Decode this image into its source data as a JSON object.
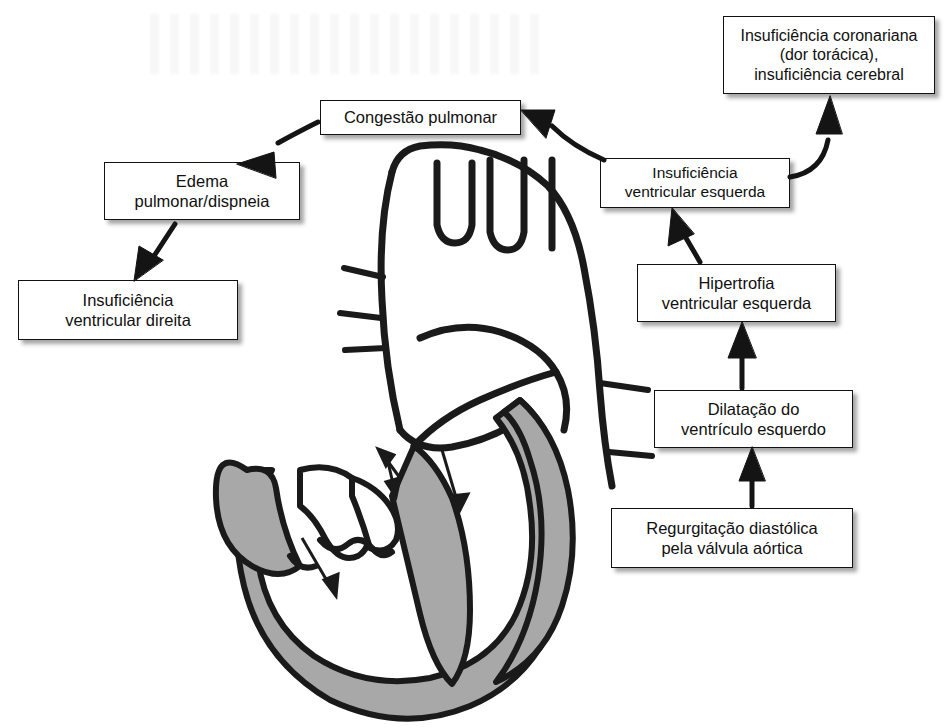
{
  "diagram": {
    "language": "pt-BR",
    "nodes": [
      {
        "id": "regurgitacao",
        "label": "Regurgitação diastólica\npela válvula aórtica"
      },
      {
        "id": "dilatacao",
        "label": "Dilatação do\nventrículo esquerdo"
      },
      {
        "id": "hipertrofia",
        "label": "Hipertrofia\nventricular esquerda"
      },
      {
        "id": "insuficiencia_ventricular_esquerda",
        "label": "Insuficiência\nventricular esquerda"
      },
      {
        "id": "insuficiencia_coronariana",
        "label": "Insuficiência coronariana\n(dor torácica),\ninsuficiência cerebral"
      },
      {
        "id": "congestao_pulmonar",
        "label": "Congestão pulmonar"
      },
      {
        "id": "edema_pulmonar",
        "label": "Edema\npulmonar/dispneia"
      },
      {
        "id": "insuficiencia_ventricular_direita",
        "label": "Insuficiência\nventricular direita"
      }
    ],
    "edges": [
      {
        "from": "regurgitacao",
        "to": "dilatacao",
        "direction": "up"
      },
      {
        "from": "dilatacao",
        "to": "hipertrofia",
        "direction": "up"
      },
      {
        "from": "hipertrofia",
        "to": "insuficiencia_ventricular_esquerda",
        "direction": "up"
      },
      {
        "from": "insuficiencia_ventricular_esquerda",
        "to": "insuficiencia_coronariana",
        "direction": "up-curved"
      },
      {
        "from": "insuficiencia_ventricular_esquerda",
        "to": "congestao_pulmonar",
        "direction": "left"
      },
      {
        "from": "congestao_pulmonar",
        "to": "edema_pulmonar",
        "direction": "down-left"
      },
      {
        "from": "edema_pulmonar",
        "to": "insuficiencia_ventricular_direita",
        "direction": "down-left"
      }
    ]
  },
  "illustration": {
    "name": "heart-cross-section",
    "description": "Corte frontal do coração com hipertrofia ventricular esquerda e setas de fluxo regurgitante",
    "colors": {
      "outline": "#1a1a1a",
      "myocardium_fill": "#a8a8a8",
      "chamber_fill": "#ffffff",
      "background": "#ffffff"
    },
    "flow_arrows": 4
  },
  "style": {
    "box_border": "#121212",
    "box_background": "#ffffff",
    "text_color": "#101010",
    "shadow": "rgba(40,40,40,0.42)"
  }
}
